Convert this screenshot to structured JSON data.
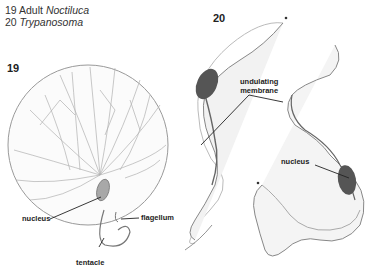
{
  "caption": {
    "line1_num": "19 Adult ",
    "line1_name": "Noctiluca",
    "line2_num": "20 ",
    "line2_name": "Trypanosoma"
  },
  "figures": [
    {
      "number": "19",
      "organism": "Adult Noctiluca",
      "labels": {
        "nucleus": "nucleus",
        "flagellum": "flagellum",
        "tentacle": "tentacle"
      }
    },
    {
      "number": "20",
      "organism": "Trypanosoma",
      "labels": {
        "undulating_membrane_1": "undulating",
        "undulating_membrane_2": "membrane",
        "nucleus": "nucleus"
      }
    }
  ],
  "colors": {
    "outline": "#8a8a8a",
    "nucleus_fill": "#555555",
    "noctiluca_nucleus": "#9a9a9a",
    "label_line": "#222222"
  }
}
